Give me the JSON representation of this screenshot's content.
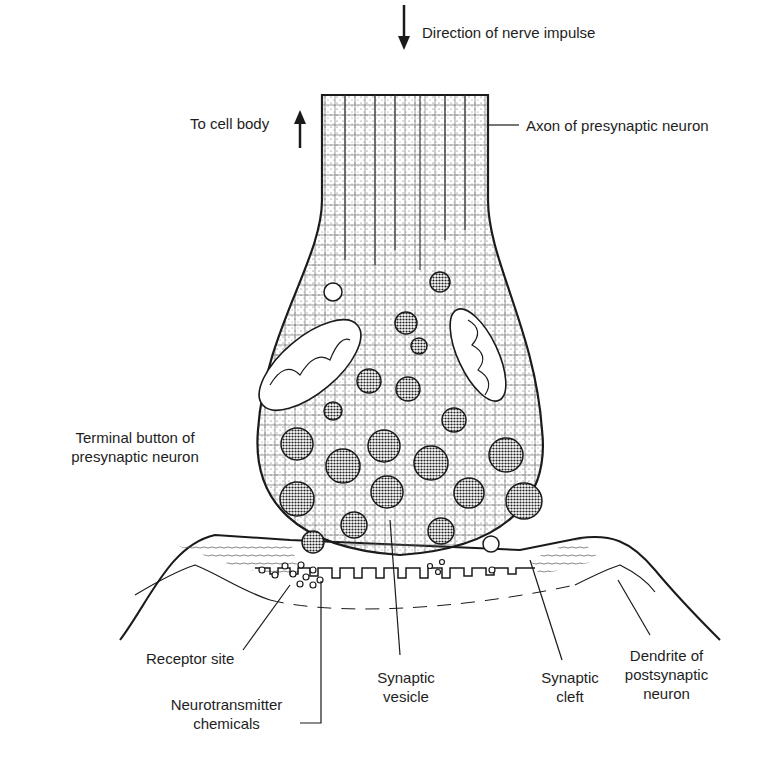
{
  "diagram": {
    "colors": {
      "ink": "#1a1a1a",
      "background": "#ffffff"
    },
    "labels": {
      "direction": "Direction of nerve impulse",
      "to_cell_body": "To cell body",
      "axon": "Axon of presynaptic neuron",
      "terminal_line1": "Terminal button of",
      "terminal_line2": "presynaptic neuron",
      "receptor": "Receptor site",
      "neuro_line1": "Neurotransmitter",
      "neuro_line2": "chemicals",
      "vesicle_line1": "Synaptic",
      "vesicle_line2": "vesicle",
      "cleft_line1": "Synaptic",
      "cleft_line2": "cleft",
      "dendrite_line1": "Dendrite of",
      "dendrite_line2": "postsynaptic",
      "dendrite_line3": "neuron"
    },
    "arrows": [
      {
        "name": "direction-arrow",
        "direction": "down"
      },
      {
        "name": "to-cell-body-arrow",
        "direction": "up"
      }
    ]
  }
}
